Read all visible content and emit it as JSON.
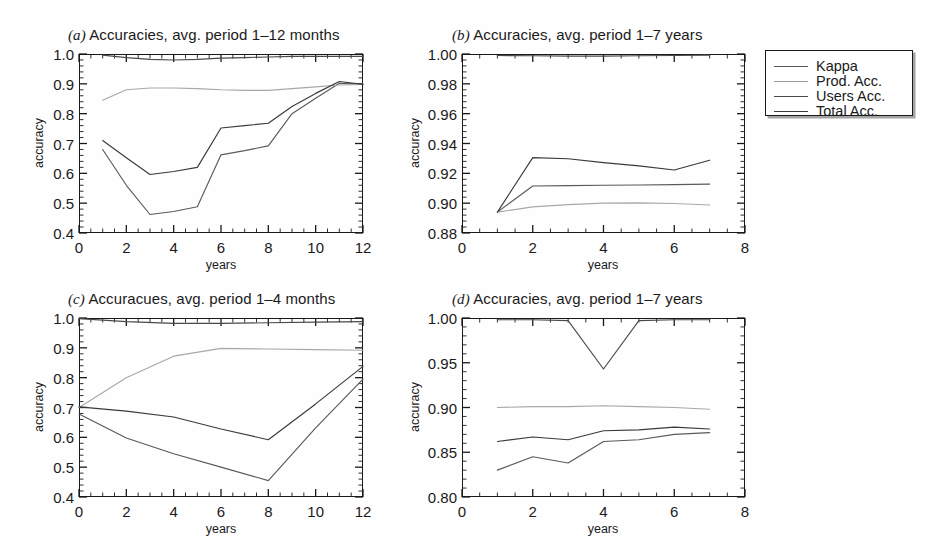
{
  "figure": {
    "background": "#fefefe",
    "line_color": "#4a4a4a",
    "axis_color": "#1a1a1a"
  },
  "legend": {
    "name": "series-legend",
    "entries": [
      {
        "label": "Kappa",
        "color": "#5a5a5a"
      },
      {
        "label": "Prod. Acc.",
        "color": "#9a9a9a"
      },
      {
        "label": "Users Acc.",
        "color": "#4a4a4a"
      },
      {
        "label": "Total Acc.",
        "color": "#3a3a3a"
      }
    ]
  },
  "chart_data": [
    {
      "panel": "a",
      "type": "line",
      "title": "Accuracies, avg. period 1–12 months",
      "tag": "(a)",
      "xlabel": "years",
      "ylabel": "accuracy",
      "xlim": [
        0,
        12
      ],
      "ylim": [
        0.4,
        1.0
      ],
      "xticks": [
        0,
        2,
        4,
        6,
        8,
        10,
        12
      ],
      "yticks": [
        0.4,
        0.5,
        0.6,
        0.7,
        0.8,
        0.9,
        1.0
      ],
      "xtick_labels": [
        "0",
        "2",
        "4",
        "6",
        "8",
        "10",
        "12"
      ],
      "ytick_labels": [
        "0.4",
        "0.5",
        "0.6",
        "0.7",
        "0.8",
        "0.9",
        "1.0"
      ],
      "grid": false,
      "x": [
        1,
        2,
        3,
        4,
        5,
        6,
        7,
        8,
        9,
        10,
        11,
        12
      ],
      "series": [
        {
          "name": "Kappa",
          "color": "#5a5a5a",
          "values": [
            0.68,
            0.56,
            0.462,
            0.472,
            0.488,
            0.662,
            0.676,
            0.692,
            0.8,
            0.852,
            0.902,
            0.898
          ]
        },
        {
          "name": "Prod. Acc.",
          "color": "#a8a8a8",
          "values": [
            0.845,
            0.88,
            0.886,
            0.886,
            0.884,
            0.88,
            0.878,
            0.878,
            0.884,
            0.89,
            0.896,
            0.898
          ]
        },
        {
          "name": "Users Acc.",
          "color": "#4a4a4a",
          "values": [
            0.996,
            0.988,
            0.982,
            0.98,
            0.982,
            0.986,
            0.988,
            0.99,
            0.992,
            0.992,
            0.992,
            0.992
          ]
        },
        {
          "name": "Total Acc.",
          "color": "#3a3a3a",
          "values": [
            0.71,
            0.652,
            0.596,
            0.606,
            0.62,
            0.752,
            0.76,
            0.768,
            0.824,
            0.868,
            0.908,
            0.898
          ]
        }
      ]
    },
    {
      "panel": "b",
      "type": "line",
      "title": "Accuracies, avg. period 1–7 years",
      "tag": "(b)",
      "xlabel": "years",
      "ylabel": "accuracy",
      "xlim": [
        0,
        8
      ],
      "ylim": [
        0.88,
        1.0
      ],
      "xticks": [
        0,
        2,
        4,
        6,
        8
      ],
      "yticks": [
        0.88,
        0.9,
        0.92,
        0.94,
        0.96,
        0.98,
        1.0
      ],
      "xtick_labels": [
        "0",
        "2",
        "4",
        "6",
        "8"
      ],
      "ytick_labels": [
        "0.88",
        "0.90",
        "0.92",
        "0.94",
        "0.96",
        "0.98",
        "1.00"
      ],
      "grid": false,
      "x": [
        1,
        2,
        3,
        4,
        5,
        6,
        7
      ],
      "series": [
        {
          "name": "Kappa",
          "color": "#5a5a5a",
          "values": [
            0.894,
            0.9115,
            0.9118,
            0.912,
            0.9122,
            0.9124,
            0.9128
          ]
        },
        {
          "name": "Prod. Acc.",
          "color": "#a8a8a8",
          "values": [
            0.894,
            0.8975,
            0.899,
            0.9,
            0.9002,
            0.8998,
            0.8988
          ]
        },
        {
          "name": "Users Acc.",
          "color": "#4a4a4a",
          "values": [
            0.999,
            0.9988,
            0.9986,
            0.9986,
            0.9988,
            0.999,
            0.9992
          ]
        },
        {
          "name": "Total Acc.",
          "color": "#3a3a3a",
          "values": [
            0.894,
            0.9305,
            0.9298,
            0.9272,
            0.925,
            0.9222,
            0.9288
          ]
        }
      ]
    },
    {
      "panel": "c",
      "type": "line",
      "title": "Accuracues, avg. period 1–4 months",
      "tag": "(c)",
      "xlabel": "years",
      "ylabel": "accuracy",
      "xlim": [
        0,
        12
      ],
      "ylim": [
        0.4,
        1.0
      ],
      "xticks": [
        0,
        2,
        4,
        6,
        8,
        10,
        12
      ],
      "yticks": [
        0.4,
        0.5,
        0.6,
        0.7,
        0.8,
        0.9,
        1.0
      ],
      "xtick_labels": [
        "0",
        "2",
        "4",
        "6",
        "8",
        "10",
        "12"
      ],
      "ytick_labels": [
        "0.4",
        "0.5",
        "0.6",
        "0.7",
        "0.8",
        "0.9",
        "1.0"
      ],
      "grid": false,
      "x": [
        0,
        2,
        4,
        6,
        8,
        10,
        12
      ],
      "series": [
        {
          "name": "Kappa",
          "color": "#5a5a5a",
          "values": [
            0.678,
            0.598,
            0.545,
            0.5,
            0.455,
            0.632,
            0.795
          ]
        },
        {
          "name": "Prod. Acc.",
          "color": "#a8a8a8",
          "values": [
            0.7,
            0.8,
            0.872,
            0.898,
            0.896,
            0.894,
            0.892
          ]
        },
        {
          "name": "Users Acc.",
          "color": "#4a4a4a",
          "values": [
            0.998,
            0.988,
            0.982,
            0.982,
            0.984,
            0.986,
            0.988
          ]
        },
        {
          "name": "Total Acc.",
          "color": "#3a3a3a",
          "values": [
            0.702,
            0.688,
            0.668,
            0.628,
            0.592,
            0.712,
            0.838
          ]
        }
      ]
    },
    {
      "panel": "d",
      "type": "line",
      "title": "Accuracies, avg. period 1–7 years",
      "tag": "(d)",
      "xlabel": "years",
      "ylabel": "accuracy",
      "xlim": [
        0,
        8
      ],
      "ylim": [
        0.8,
        1.0
      ],
      "xticks": [
        0,
        2,
        4,
        6,
        8
      ],
      "yticks": [
        0.8,
        0.85,
        0.9,
        0.95,
        1.0
      ],
      "xtick_labels": [
        "0",
        "2",
        "4",
        "6",
        "8"
      ],
      "ytick_labels": [
        "0.80",
        "0.85",
        "0.90",
        "0.95",
        "1.00"
      ],
      "grid": false,
      "x": [
        1,
        2,
        3,
        4,
        5,
        6,
        7
      ],
      "series": [
        {
          "name": "Kappa",
          "color": "#5a5a5a",
          "values": [
            0.83,
            0.845,
            0.838,
            0.862,
            0.864,
            0.87,
            0.872
          ]
        },
        {
          "name": "Prod. Acc.",
          "color": "#a8a8a8",
          "values": [
            0.9,
            0.901,
            0.901,
            0.902,
            0.901,
            0.9,
            0.898
          ]
        },
        {
          "name": "Users Acc.",
          "color": "#4a4a4a",
          "values": [
            0.998,
            0.998,
            0.997,
            0.943,
            0.997,
            0.998,
            0.998
          ]
        },
        {
          "name": "Total Acc.",
          "color": "#3a3a3a",
          "values": [
            0.862,
            0.867,
            0.864,
            0.874,
            0.875,
            0.878,
            0.876
          ]
        }
      ]
    }
  ]
}
